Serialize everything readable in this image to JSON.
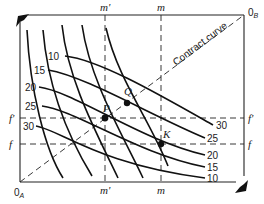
{
  "diagram": {
    "type": "edgeworth-box",
    "origins": {
      "A": "0A",
      "B": "0B",
      "A_base": "0",
      "A_sub": "A",
      "B_base": "0",
      "B_sub": "B"
    },
    "contract_curve_label": "Contract curve",
    "vertical_lines": [
      {
        "label": "m'",
        "position": "left"
      },
      {
        "label": "m",
        "position": "right"
      }
    ],
    "horizontal_lines": [
      {
        "label": "f'",
        "position": "upper"
      },
      {
        "label": "f",
        "position": "lower"
      }
    ],
    "points": [
      {
        "label": "P",
        "at": "m' × f'"
      },
      {
        "label": "Q",
        "on": "contract curve"
      },
      {
        "label": "K",
        "at": "m × f"
      }
    ],
    "indifference_curves_A": [
      "10",
      "15",
      "20",
      "25",
      "30"
    ],
    "indifference_curves_B": [
      "30",
      "25",
      "20",
      "15",
      "10"
    ]
  }
}
